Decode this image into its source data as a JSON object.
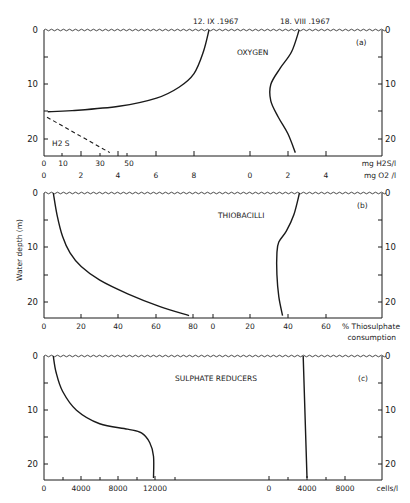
{
  "figure": {
    "y_axis_label": "Water depth (m)",
    "panels": [
      {
        "id": "a",
        "letter": "(a)",
        "title": "OXYGEN",
        "y_ticks": [
          "0",
          "10",
          "20"
        ]
      },
      {
        "id": "b",
        "letter": "(b)",
        "title": "THIOBACILLI",
        "y_ticks": [
          "0",
          "10",
          "20"
        ]
      },
      {
        "id": "c",
        "letter": "(c)",
        "title": "SULPHATE REDUCERS",
        "y_ticks": [
          "0",
          "10",
          "20"
        ]
      }
    ],
    "dates": [
      "12. IX .1967",
      "18. VIII .1967"
    ],
    "a_axis": {
      "h2s_ticks": [
        "0",
        "10",
        "30",
        "50"
      ],
      "h2s_unit": "mg H2S/l",
      "o2_left_ticks": [
        "0",
        "2",
        "4",
        "6",
        "8"
      ],
      "o2_right_ticks": [
        "0",
        "2",
        "4"
      ],
      "o2_unit": "mg O2 /l",
      "h2s_label": "H2 S"
    },
    "b_axis": {
      "left_ticks": [
        "0",
        "20",
        "40",
        "60",
        "80"
      ],
      "right_ticks": [
        "0",
        "20",
        "40",
        "60"
      ],
      "unit_line1": "% Thiosulphate",
      "unit_line2": "consumption"
    },
    "c_axis": {
      "left_ticks": [
        "0",
        "4000",
        "8000",
        "12000"
      ],
      "right_ticks": [
        "0",
        "4000",
        "8000"
      ],
      "unit": "cells/l"
    }
  },
  "chart_data": [
    {
      "type": "line",
      "title": "(a) OXYGEN",
      "ylabel": "Water depth (m)",
      "ylim": [
        0,
        23
      ],
      "y_inverted": true,
      "series": [
        {
          "name": "O2 12.IX.1967",
          "unit": "mg O2/l",
          "x": [
            8.8,
            8.5,
            8.0,
            7.2,
            6.0,
            4.0,
            1.5,
            0.2
          ],
          "y": [
            0,
            4,
            8,
            10.5,
            12.5,
            14,
            14.8,
            15
          ]
        },
        {
          "name": "O2 18.VIII.1967",
          "unit": "mg O2/l",
          "x": [
            2.6,
            2.2,
            1.6,
            1.1,
            1.1,
            1.5,
            2.0,
            2.4
          ],
          "y": [
            0,
            4,
            7,
            10,
            13,
            16,
            19,
            22.5
          ]
        },
        {
          "name": "H2S 12.IX.1967",
          "unit": "mg H2S/l",
          "style": "dashed",
          "x": [
            0,
            35
          ],
          "y": [
            16,
            22.5
          ]
        }
      ],
      "x_ticks_h2s": [
        0,
        10,
        30,
        50
      ],
      "x_ticks_o2_left": [
        0,
        2,
        4,
        6,
        8
      ],
      "x_ticks_o2_right": [
        0,
        2,
        4
      ]
    },
    {
      "type": "line",
      "title": "(b) THIOBACILLI",
      "xlabel": "% Thiosulphate consumption",
      "ylabel": "Water depth (m)",
      "ylim": [
        0,
        23
      ],
      "y_inverted": true,
      "series": [
        {
          "name": "12.IX.1967",
          "x": [
            5,
            7,
            10,
            14,
            20,
            30,
            45,
            62,
            78
          ],
          "y": [
            0,
            4,
            8,
            11,
            13.5,
            16,
            18.5,
            20.8,
            22.5
          ]
        },
        {
          "name": "18.VIII.1967",
          "x": [
            46,
            43,
            39,
            35,
            34,
            34,
            35,
            37
          ],
          "y": [
            0,
            4,
            7,
            9,
            11,
            15,
            19,
            22.5
          ]
        }
      ],
      "x_ticks_left": [
        0,
        20,
        40,
        60,
        80
      ],
      "x_ticks_right": [
        0,
        20,
        40,
        60
      ]
    },
    {
      "type": "line",
      "title": "(c) SULPHATE REDUCERS",
      "xlabel": "cells/l",
      "ylabel": "Water depth (m)",
      "ylim": [
        0,
        23
      ],
      "y_inverted": true,
      "series": [
        {
          "name": "12.IX.1967",
          "x": [
            1000,
            1300,
            2000,
            3500,
            6000,
            9000,
            10500,
            11400,
            11800,
            11800
          ],
          "y": [
            0,
            3,
            6.5,
            10,
            12.5,
            13.5,
            14.2,
            16,
            18.5,
            22.5
          ]
        },
        {
          "name": "18.VIII.1967",
          "x": [
            3600,
            4000
          ],
          "y": [
            0,
            22.5
          ]
        }
      ],
      "x_ticks_left": [
        0,
        4000,
        8000,
        12000
      ],
      "x_ticks_right": [
        0,
        4000,
        8000
      ]
    }
  ]
}
